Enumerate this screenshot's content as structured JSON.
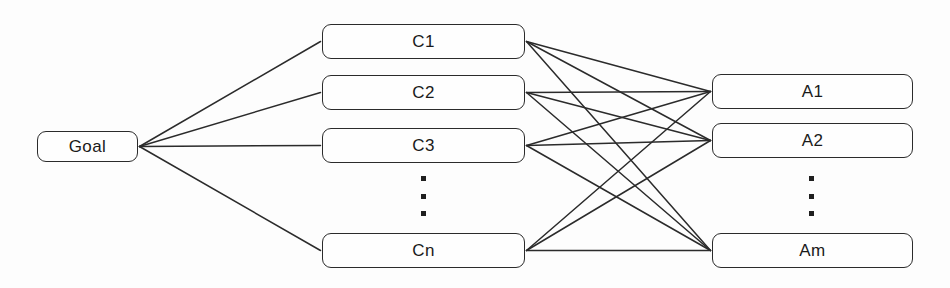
{
  "diagram": {
    "type": "hierarchy-diagram",
    "canvas": {
      "width": 950,
      "height": 288
    },
    "colors": {
      "background": "#fdfdfd",
      "box_fill": "#fefefe",
      "box_stroke": "#2b2b2b",
      "edge_stroke": "#2b2b2b",
      "text": "#1a1a1a"
    },
    "levels": [
      {
        "name": "goal-level",
        "label": "Goal level"
      },
      {
        "name": "criteria-level",
        "label": "Criteria level"
      },
      {
        "name": "alternatives-level",
        "label": "Alternatives level"
      }
    ],
    "nodes": [
      {
        "id": "goal",
        "label": "Goal",
        "level": "goal-level",
        "x": 37,
        "y": 131,
        "w": 101,
        "h": 31
      },
      {
        "id": "c1",
        "label": "C1",
        "level": "criteria-level",
        "x": 322,
        "y": 24,
        "w": 203,
        "h": 35
      },
      {
        "id": "c2",
        "label": "C2",
        "level": "criteria-level",
        "x": 322,
        "y": 75,
        "w": 203,
        "h": 35
      },
      {
        "id": "c3",
        "label": "C3",
        "level": "criteria-level",
        "x": 322,
        "y": 128,
        "w": 203,
        "h": 35
      },
      {
        "id": "cn",
        "label": "Cn",
        "level": "criteria-level",
        "x": 322,
        "y": 233,
        "w": 203,
        "h": 35
      },
      {
        "id": "a1",
        "label": "A1",
        "level": "alternatives-level",
        "x": 712,
        "y": 74,
        "w": 201,
        "h": 35
      },
      {
        "id": "a2",
        "label": "A2",
        "level": "alternatives-level",
        "x": 712,
        "y": 123,
        "w": 201,
        "h": 35
      },
      {
        "id": "am",
        "label": "Am",
        "level": "alternatives-level",
        "x": 712,
        "y": 233,
        "w": 201,
        "h": 35
      }
    ],
    "ellipses": [
      {
        "id": "criteria-ellipsis",
        "glyph": "vertical-dots",
        "dots": 3,
        "x": 420,
        "y": 176,
        "h": 40
      },
      {
        "id": "alternatives-ellipsis",
        "glyph": "vertical-dots",
        "dots": 3,
        "x": 808,
        "y": 176,
        "h": 40
      }
    ],
    "edges": [
      {
        "from": "goal",
        "to": "c1"
      },
      {
        "from": "goal",
        "to": "c2"
      },
      {
        "from": "goal",
        "to": "c3"
      },
      {
        "from": "goal",
        "to": "cn"
      },
      {
        "from": "c1",
        "to": "a1"
      },
      {
        "from": "c1",
        "to": "a2"
      },
      {
        "from": "c1",
        "to": "am"
      },
      {
        "from": "c2",
        "to": "a1"
      },
      {
        "from": "c2",
        "to": "a2"
      },
      {
        "from": "c2",
        "to": "am"
      },
      {
        "from": "c3",
        "to": "a1"
      },
      {
        "from": "c3",
        "to": "a2"
      },
      {
        "from": "c3",
        "to": "am"
      },
      {
        "from": "cn",
        "to": "a1"
      },
      {
        "from": "cn",
        "to": "a2"
      },
      {
        "from": "cn",
        "to": "am"
      }
    ]
  }
}
